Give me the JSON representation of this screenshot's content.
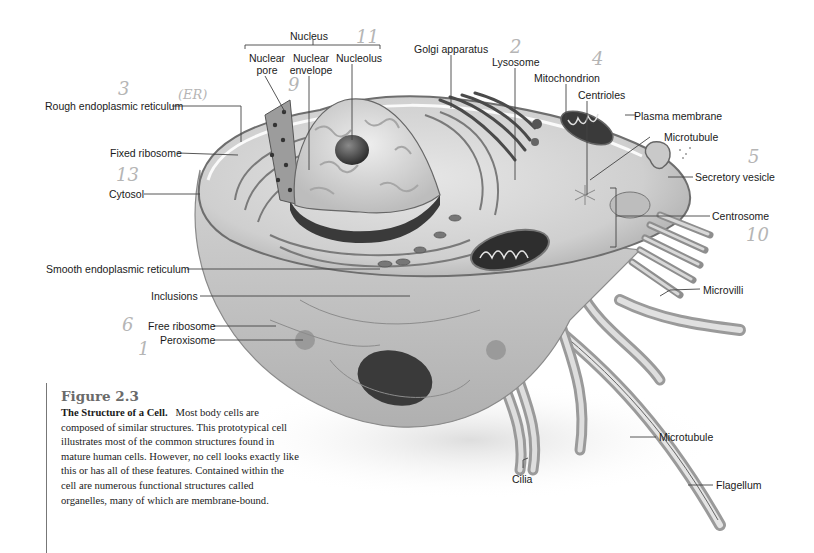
{
  "figure": {
    "number": "Figure 2.3",
    "title": "The Structure of a Cell.",
    "caption_text": "Most body cells are composed of similar structures. This prototypical cell illustrates most of the common structures found in mature human cells. However, no cell looks exactly like this or has all of these features. Contained within the cell are numerous functional structures called organelles, many of which are membrane-bound."
  },
  "labels": {
    "nucleus": "Nucleus",
    "nuclear_pore_1": "Nuclear",
    "nuclear_pore_2": "pore",
    "nuclear_envelope_1": "Nuclear",
    "nuclear_envelope_2": "envelope",
    "nucleolus": "Nucleolus",
    "golgi": "Golgi apparatus",
    "lysosome": "Lysosome",
    "mitochondrion": "Mitochondrion",
    "centrioles": "Centrioles",
    "plasma_membrane": "Plasma membrane",
    "microtubule_top": "Microtubule",
    "secretory_vesicle": "Secretory vesicle",
    "centrosome": "Centrosome",
    "rough_er": "Rough endoplasmic reticulum",
    "fixed_ribosome": "Fixed ribosome",
    "cytosol": "Cytosol",
    "smooth_er": "Smooth endoplasmic reticulum",
    "inclusions": "Inclusions",
    "free_ribosome": "Free ribosome",
    "peroxisome": "Peroxisome",
    "microvilli": "Microvilli",
    "microtubule_bottom": "Microtubule",
    "cilia": "Cilia",
    "flagellum": "Flagellum"
  },
  "handwritten_annotations": {
    "n11": "11",
    "n9": "9",
    "n3": "3",
    "er": "(ER)",
    "n13": "13",
    "n2": "2",
    "n4": "4",
    "n5": "5",
    "n10": "10",
    "n6": "6",
    "n1": "1"
  }
}
